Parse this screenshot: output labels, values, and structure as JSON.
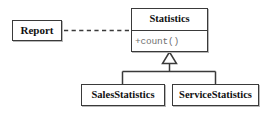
{
  "diagram": {
    "kind": "uml-class-diagram",
    "canvas": {
      "width": 270,
      "height": 113,
      "background": "#ffffff"
    },
    "stroke_color": "#3a3a3a",
    "shadow_color": "#b8b8b8",
    "text_color": "#111111",
    "operation_color": "#6f6f6f"
  },
  "classes": {
    "report": {
      "name": "Report",
      "operations": []
    },
    "statistics": {
      "name": "Statistics",
      "operations": [
        {
          "text": "+count()",
          "visibility": "+",
          "label": "count()"
        }
      ]
    },
    "sales_statistics": {
      "name": "SalesStatistics",
      "operations": []
    },
    "service_statistics": {
      "name": "ServiceStatistics",
      "operations": []
    }
  },
  "relationships": [
    {
      "id": "dependency",
      "type": "dependency",
      "line_style": "dashed",
      "arrowhead": "open-filled",
      "source": "Report",
      "target": "Statistics",
      "label": ""
    },
    {
      "id": "generalization-sales",
      "type": "generalization",
      "line_style": "solid",
      "arrowhead": "hollow-triangle",
      "source": "SalesStatistics",
      "target": "Statistics",
      "label": ""
    },
    {
      "id": "generalization-service",
      "type": "generalization",
      "line_style": "solid",
      "arrowhead": "hollow-triangle",
      "source": "ServiceStatistics",
      "target": "Statistics",
      "label": ""
    }
  ]
}
